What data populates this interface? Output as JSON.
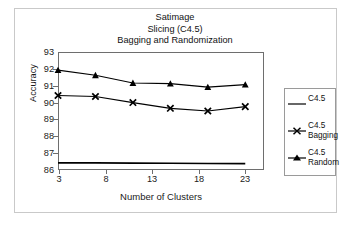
{
  "chart_data": {
    "type": "line",
    "title": "Satimage\nSlicing (C4.5)\nBagging and Randomization",
    "title_lines": [
      "Satimage",
      "Slicing (C4.5)",
      "Bagging and Randomization"
    ],
    "xlabel": "Number of Clusters",
    "ylabel": "Accuracy",
    "xlim": [
      3,
      25
    ],
    "ylim": [
      86,
      93
    ],
    "xticks": [
      3,
      8,
      13,
      18,
      23
    ],
    "yticks": [
      86,
      87,
      88,
      89,
      90,
      91,
      92,
      93
    ],
    "grid": false,
    "legend_position": "right",
    "x": [
      3,
      7,
      11,
      15,
      19,
      23
    ],
    "series": [
      {
        "name": "C4.5",
        "marker": "none",
        "color": "#000000",
        "values": [
          86.42,
          86.42,
          86.41,
          86.4,
          86.39,
          86.38
        ]
      },
      {
        "name": "C4.5 Bagging",
        "marker": "x",
        "color": "#000000",
        "values": [
          90.42,
          90.36,
          90.0,
          89.66,
          89.5,
          89.76
        ]
      },
      {
        "name": "C4.5 Random",
        "marker": "triangle",
        "color": "#000000",
        "values": [
          91.92,
          91.62,
          91.16,
          91.12,
          90.92,
          91.06
        ]
      }
    ]
  },
  "legend": {
    "entries": [
      {
        "label_line1": "C4.5",
        "label_line2": ""
      },
      {
        "label_line1": "C4.5",
        "label_line2": "Bagging"
      },
      {
        "label_line1": "C4.5",
        "label_line2": "Random"
      }
    ]
  },
  "axis": {
    "ytick_labels": [
      "93",
      "92",
      "91",
      "90",
      "89",
      "88",
      "87",
      "86"
    ],
    "xtick_labels": [
      "3",
      "8",
      "13",
      "18",
      "23"
    ]
  },
  "colors": {
    "line": "#000000",
    "frame": "#6e6e6e",
    "outer_border": "#c9c9c9",
    "background": "#ffffff"
  }
}
